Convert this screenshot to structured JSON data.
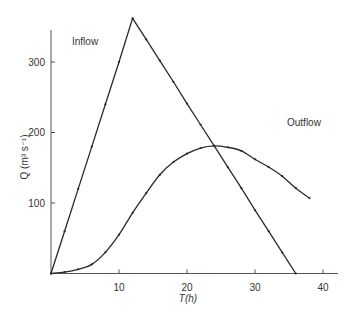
{
  "chart_data": {
    "type": "line",
    "title": "",
    "xlabel": "T(h)",
    "ylabel": "Q (m³ s⁻¹)",
    "xlim": [
      0,
      43
    ],
    "ylim": [
      0,
      365
    ],
    "x_ticks": [
      "10",
      "20",
      "30",
      "40"
    ],
    "y_ticks": [
      "100",
      "200",
      "300"
    ],
    "grid": false,
    "legend": "inline labels",
    "series": [
      {
        "name": "Inflow",
        "x": [
          0,
          2,
          4,
          6,
          8,
          10,
          12,
          14,
          16,
          18,
          20,
          22,
          24,
          26,
          28,
          30,
          32,
          34,
          36
        ],
        "values": [
          0,
          60,
          120,
          180,
          240,
          300,
          362,
          332,
          302,
          272,
          241,
          211,
          181,
          151,
          121,
          90,
          60,
          30,
          0
        ]
      },
      {
        "name": "Outflow",
        "x": [
          0,
          2,
          4,
          6,
          8,
          10,
          12,
          14,
          16,
          18,
          20,
          22,
          24,
          26,
          28,
          30,
          32,
          34,
          36,
          38
        ],
        "values": [
          0,
          2,
          6,
          13,
          30,
          55,
          86,
          114,
          140,
          158,
          170,
          178,
          181,
          179,
          174,
          162,
          151,
          138,
          121,
          107
        ]
      }
    ]
  },
  "labels": {
    "inflow": "Inflow",
    "outflow": "Outflow",
    "xlabel": "T(h)",
    "ylabel": "Q (m³ s⁻¹)"
  },
  "colors": {
    "line": "#2a2a2a",
    "axis": "#555555"
  }
}
